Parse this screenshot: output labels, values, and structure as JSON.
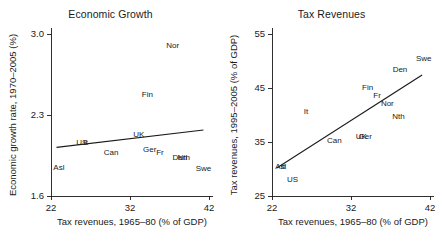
{
  "figure": {
    "background": "#ffffff",
    "ink_color": "#1a1a1a",
    "panel_count": 2
  },
  "chart_data": [
    {
      "type": "scatter",
      "panel_id": "economic-growth",
      "title": "Economic Growth",
      "xlabel": "Tax revenues, 1965–80 (% of GDP)",
      "ylabel": "Economic growth rate, 1970–2005 (%)",
      "xlim": [
        22,
        42
      ],
      "ylim": [
        1.6,
        3.0
      ],
      "xticks": [
        22,
        32,
        42
      ],
      "xticklabels": [
        "22",
        "32",
        "42"
      ],
      "yticks": [
        1.6,
        2.3,
        3.0
      ],
      "yticklabels": [
        "1.6",
        "2.3",
        "3.0"
      ],
      "grid": false,
      "legend": "none",
      "marker_style": "text-label-only",
      "points": [
        {
          "label": "Asl",
          "x": 23.0,
          "y": 1.84
        },
        {
          "label": "US",
          "x": 25.9,
          "y": 2.06
        },
        {
          "label": "It",
          "x": 26.4,
          "y": 2.06
        },
        {
          "label": "Can",
          "x": 29.6,
          "y": 1.97
        },
        {
          "label": "UK",
          "x": 33.1,
          "y": 2.13
        },
        {
          "label": "Ger",
          "x": 34.5,
          "y": 2.0
        },
        {
          "label": "Fr",
          "x": 35.8,
          "y": 1.97
        },
        {
          "label": "Fin",
          "x": 34.2,
          "y": 2.47
        },
        {
          "label": "Nor",
          "x": 37.4,
          "y": 2.9
        },
        {
          "label": "Den",
          "x": 38.3,
          "y": 1.93
        },
        {
          "label": "Nth",
          "x": 38.8,
          "y": 1.93
        },
        {
          "label": "Swe",
          "x": 41.3,
          "y": 1.83
        }
      ],
      "fit_line": {
        "type": "linear-fit",
        "x_start": 22.7,
        "y_start": 2.02,
        "x_end": 41.3,
        "y_end": 2.17
      }
    },
    {
      "type": "scatter",
      "panel_id": "tax-revenues",
      "title": "Tax Revenues",
      "xlabel": "Tax revenues, 1965–80 (% of GDP)",
      "ylabel": "Tax revenues, 1995–2005 (% of GDP)",
      "xlim": [
        22,
        42
      ],
      "ylim": [
        25,
        55
      ],
      "xticks": [
        22,
        32,
        42
      ],
      "xticklabels": [
        "22",
        "32",
        "42"
      ],
      "yticks": [
        25,
        35,
        45,
        55
      ],
      "yticklabels": [
        "25",
        "35",
        "45",
        "55"
      ],
      "grid": false,
      "legend": "none",
      "marker_style": "text-label-only",
      "points": [
        {
          "label": "Asl",
          "x": 23.1,
          "y": 30.3
        },
        {
          "label": "It",
          "x": 23.4,
          "y": 30.3
        },
        {
          "label": "US",
          "x": 24.6,
          "y": 27.9
        },
        {
          "label": "It",
          "x": 26.3,
          "y": 40.6
        },
        {
          "label": "Can",
          "x": 29.9,
          "y": 35.2
        },
        {
          "label": "UK",
          "x": 33.3,
          "y": 36.0
        },
        {
          "label": "Ger",
          "x": 33.8,
          "y": 36.0
        },
        {
          "label": "Fin",
          "x": 34.1,
          "y": 45.0
        },
        {
          "label": "Fr",
          "x": 35.3,
          "y": 43.5
        },
        {
          "label": "Nor",
          "x": 36.6,
          "y": 42.1
        },
        {
          "label": "Nth",
          "x": 38.0,
          "y": 39.7
        },
        {
          "label": "Den",
          "x": 38.2,
          "y": 48.4
        },
        {
          "label": "Swe",
          "x": 41.2,
          "y": 50.3
        }
      ],
      "fit_line": {
        "type": "linear-fit",
        "x_start": 22.6,
        "y_start": 30.2,
        "x_end": 41.0,
        "y_end": 47.4
      }
    }
  ]
}
